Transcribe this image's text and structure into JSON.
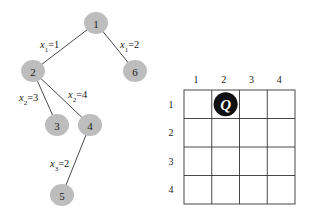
{
  "tree": {
    "nodes": [
      {
        "id": "1",
        "label": "1",
        "x": 96,
        "y": 23
      },
      {
        "id": "2",
        "label": "2",
        "x": 33,
        "y": 71
      },
      {
        "id": "6",
        "label": "6",
        "x": 135,
        "y": 71
      },
      {
        "id": "3",
        "label": "3",
        "x": 57,
        "y": 125
      },
      {
        "id": "4",
        "label": "4",
        "x": 90,
        "y": 125
      },
      {
        "id": "5",
        "label": "5",
        "x": 62,
        "y": 195
      }
    ],
    "edges": [
      {
        "from": "1",
        "to": "2",
        "var": "x",
        "sub": "1",
        "value": "=1",
        "lx": 40,
        "ly": 48
      },
      {
        "from": "1",
        "to": "6",
        "var": "x",
        "sub": "1",
        "value": "=2",
        "lx": 120,
        "ly": 48
      },
      {
        "from": "2",
        "to": "3",
        "var": "x",
        "sub": "2",
        "value": "=3",
        "lx": 19,
        "ly": 101
      },
      {
        "from": "2",
        "to": "4",
        "var": "x",
        "sub": "2",
        "value": "=4",
        "lx": 68,
        "ly": 98
      },
      {
        "from": "4",
        "to": "5",
        "var": "x",
        "sub": "3",
        "value": "=2",
        "lx": 50,
        "ly": 167
      }
    ]
  },
  "board": {
    "size": 4,
    "column_labels": [
      "1",
      "2",
      "3",
      "4"
    ],
    "row_labels": [
      "1",
      "2",
      "3",
      "4"
    ],
    "queen": {
      "row": 1,
      "col": 2,
      "symbol": "Q"
    }
  }
}
